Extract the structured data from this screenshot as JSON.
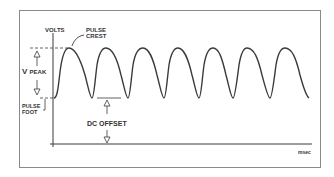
{
  "diagram": {
    "labels": {
      "y_axis": "VOLTS",
      "crest": "PULSE CREST",
      "crest_line1": "PULSE",
      "crest_line2": "CREST",
      "vpeak_main": "V",
      "vpeak_sub": "PEAK",
      "foot_line1": "PULSE",
      "foot_line2": "FOOT",
      "dc_offset": "DC OFFSET",
      "x_axis": "msec"
    },
    "colors": {
      "line": "#3a3a3a",
      "frame": "#8a8a8a",
      "background": "#ffffff"
    },
    "waveform": {
      "type": "rectified-pulse",
      "pulse_count": 7,
      "crest_y_px": 48,
      "foot_y_px": 98,
      "crest_x_px": [
        69,
        106,
        143,
        178,
        213,
        247,
        285
      ],
      "trough_x_px": [
        92,
        128,
        164,
        199,
        233,
        270
      ]
    },
    "axes": {
      "origin_px": [
        53,
        144
      ],
      "x_end_px": 312,
      "y_top_px": 33
    }
  }
}
